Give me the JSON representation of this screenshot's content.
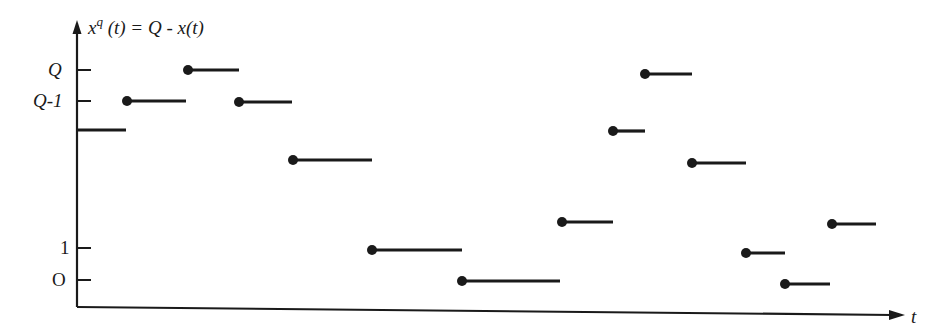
{
  "chart_data": {
    "type": "step",
    "title": "",
    "ylabel": "x^q (t) = Q - x(t)",
    "ylabel_parts": {
      "base": "x",
      "sup": "q",
      "rest": " (t) = Q - x(t)"
    },
    "xlabel": "t",
    "y_ticks": [
      {
        "label": "Q",
        "level": "Q"
      },
      {
        "label": "Q-1",
        "level": "Q-1"
      },
      {
        "label": "1",
        "level": "1"
      },
      {
        "label": "O",
        "level": "0"
      }
    ],
    "note": "Piecewise-constant queue-related process; each segment starts with a filled dot (right-continuous jump) except the first, which begins at the axis.",
    "segments": [
      {
        "level_label": "Q-2",
        "x_start": 78,
        "x_end": 126,
        "y": 130,
        "dot": false
      },
      {
        "level_label": "Q-1",
        "x_start": 127,
        "x_end": 186,
        "y": 101,
        "dot": true
      },
      {
        "level_label": "Q",
        "x_start": 188,
        "x_end": 239,
        "y": 70,
        "dot": true
      },
      {
        "level_label": "Q-1",
        "x_start": 239,
        "x_end": 292,
        "y": 102,
        "dot": true
      },
      {
        "level_label": "Q-3",
        "x_start": 293,
        "x_end": 372,
        "y": 160,
        "dot": true
      },
      {
        "level_label": "1",
        "x_start": 372,
        "x_end": 462,
        "y": 250,
        "dot": true
      },
      {
        "level_label": "0",
        "x_start": 462,
        "x_end": 560,
        "y": 281,
        "dot": true
      },
      {
        "level_label": "2",
        "x_start": 562,
        "x_end": 613,
        "y": 222,
        "dot": true
      },
      {
        "level_label": "Q-2",
        "x_start": 613,
        "x_end": 645,
        "y": 131,
        "dot": true
      },
      {
        "level_label": "Q",
        "x_start": 645,
        "x_end": 692,
        "y": 74,
        "dot": true
      },
      {
        "level_label": "Q-3",
        "x_start": 692,
        "x_end": 746,
        "y": 163,
        "dot": true
      },
      {
        "level_label": "1",
        "x_start": 746,
        "x_end": 785,
        "y": 253,
        "dot": true
      },
      {
        "level_label": "0",
        "x_start": 785,
        "x_end": 830,
        "y": 284,
        "dot": true
      },
      {
        "level_label": "2",
        "x_start": 832,
        "x_end": 876,
        "y": 224,
        "dot": true
      }
    ],
    "axes": {
      "origin": [
        77,
        307
      ],
      "y_top": 22,
      "x_right": 905
    }
  }
}
